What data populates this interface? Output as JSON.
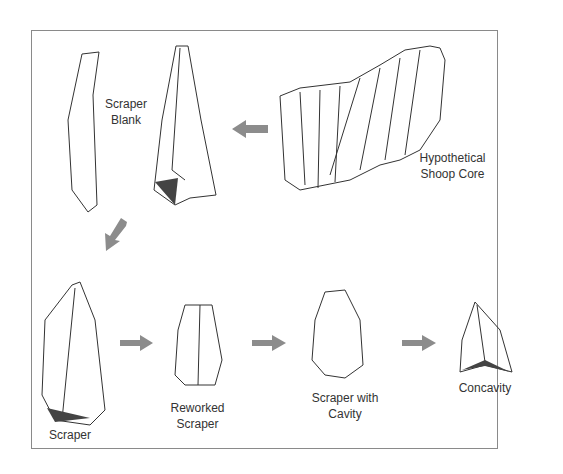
{
  "diagram": {
    "labels": {
      "scraper_blank": [
        "Scraper",
        "Blank"
      ],
      "core": [
        "Hypothetical",
        "Shoop Core"
      ],
      "scraper": "Scraper",
      "reworked": [
        "Reworked",
        "Scraper"
      ],
      "cavity": [
        "Scraper with",
        "Cavity"
      ],
      "concavity": "Concavity"
    },
    "arrow_color": "#8c8c8c",
    "flow": [
      "Hypothetical Shoop Core",
      "Scraper Blank",
      "Scraper",
      "Reworked Scraper",
      "Scraper with Cavity",
      "Concavity"
    ]
  }
}
